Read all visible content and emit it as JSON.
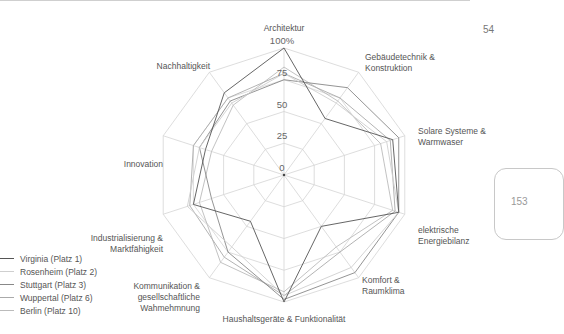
{
  "page": {
    "number": "54",
    "side_tab": "153"
  },
  "chart_data": {
    "type": "radar",
    "title": "",
    "axes": [
      "Architektur",
      "Gebäudetechnik & Konstruktion",
      "Solare Systeme & Warmwaser",
      "elektrische Energiebilanz",
      "Komfort & Raumklima",
      "Haushaltsgeräte & Funktionalität",
      "Kommunikation & gesellschaftliche Wahmehmnung",
      "Industrialisierung & Marktfähigkeit",
      "Innovation",
      "Nachhaltigkeit"
    ],
    "ticks": [
      "0",
      "25",
      "50",
      "75",
      "100%"
    ],
    "range": [
      0,
      100
    ],
    "series": [
      {
        "name": "Virginia (Platz 1)",
        "color": "#555555",
        "values": [
          100,
          55,
          90,
          95,
          50,
          100,
          45,
          75,
          65,
          80
        ]
      },
      {
        "name": "Rosenheim (Platz 2)",
        "color": "#cfcfcf",
        "values": [
          80,
          70,
          85,
          95,
          90,
          95,
          70,
          80,
          70,
          70
        ]
      },
      {
        "name": "Stuttgart (Platz 3)",
        "color": "#888888",
        "values": [
          75,
          85,
          95,
          95,
          95,
          98,
          75,
          60,
          70,
          72
        ]
      },
      {
        "name": "Wuppertal (Platz 6)",
        "color": "#aaaaaa",
        "values": [
          80,
          75,
          88,
          92,
          75,
          95,
          80,
          78,
          75,
          75
        ]
      },
      {
        "name": "Berlin (Platz 10)",
        "color": "#bbbbbb",
        "values": [
          85,
          72,
          80,
          90,
          70,
          92,
          85,
          70,
          60,
          68
        ]
      }
    ]
  },
  "axis_labels": [
    {
      "lines": [
        "Architektur"
      ]
    },
    {
      "lines": [
        "Gebäudetechnik &",
        "Konstruktion"
      ]
    },
    {
      "lines": [
        "Solare Systeme &",
        "Warmwaser"
      ]
    },
    {
      "lines": [
        "elektrische",
        "Energiebilanz"
      ]
    },
    {
      "lines": [
        "Komfort &",
        "Raumklima"
      ]
    },
    {
      "lines": [
        "Haushaltsgeräte & Funktionalität"
      ]
    },
    {
      "lines": [
        "Kommunikation &",
        "gesellschaftliche",
        "Wahmehmnung"
      ]
    },
    {
      "lines": [
        "Industrialisierung &",
        "Marktfähigkeit"
      ]
    },
    {
      "lines": [
        "Innovation"
      ]
    },
    {
      "lines": [
        "Nachhaltigkeit"
      ]
    }
  ],
  "legend": [
    {
      "label": "Virginia (Platz 1)",
      "color": "#555555"
    },
    {
      "label": "Rosenheim (Platz 2)",
      "color": "#cfcfcf"
    },
    {
      "label": "Stuttgart (Platz 3)",
      "color": "#888888"
    },
    {
      "label": "Wuppertal (Platz 6)",
      "color": "#aaaaaa"
    },
    {
      "label": "Berlin (Platz 10)",
      "color": "#bbbbbb"
    }
  ]
}
